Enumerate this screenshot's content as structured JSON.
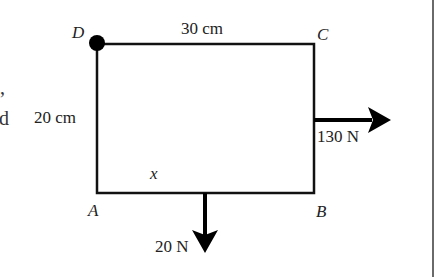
{
  "diagram": {
    "type": "rigid-plate-forces",
    "vertices": {
      "A": {
        "label": "A",
        "x": 97,
        "y": 193
      },
      "B": {
        "label": "B",
        "x": 314,
        "y": 193
      },
      "C": {
        "label": "C",
        "x": 314,
        "y": 44
      },
      "D": {
        "label": "D",
        "x": 97,
        "y": 44
      }
    },
    "pivot": {
      "at": "D",
      "marker": "filled-circle"
    },
    "dimensions": {
      "top": "30 cm",
      "left": "20 cm",
      "bottom_unknown": "x"
    },
    "forces": [
      {
        "label": "130 N",
        "direction": "right",
        "applied_on": "BC"
      },
      {
        "label": "20 N",
        "direction": "down",
        "applied_on": "AB"
      }
    ],
    "colors": {
      "line": "#111111",
      "text": "#222222",
      "page_border": "#6a6a6a"
    }
  },
  "left_margin_fragments": [
    ",",
    "d"
  ]
}
